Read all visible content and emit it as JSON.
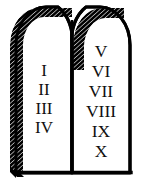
{
  "image": {
    "title": "Ten Commandments Tablets",
    "subject": "two-stone-tablets",
    "style": "black-and-white-line-art",
    "background_color": "#ffffff",
    "ink_color": "#000000",
    "numeral_color": "#101010",
    "width": 144,
    "height": 190
  },
  "tablets": {
    "count": 2,
    "shape": "round-arched-top-flat-bottom",
    "shading": "diagonal-hatching-on-upper-left-edges",
    "left": {
      "label": "left-tablet",
      "numerals": [
        {
          "value": "I",
          "order": 1
        },
        {
          "value": "II",
          "order": 2
        },
        {
          "value": "III",
          "order": 3
        },
        {
          "value": "IV",
          "order": 4
        }
      ]
    },
    "right": {
      "label": "right-tablet",
      "numerals": [
        {
          "value": "V",
          "order": 5
        },
        {
          "value": "VI",
          "order": 6
        },
        {
          "value": "VII",
          "order": 7
        },
        {
          "value": "VIII",
          "order": 8
        },
        {
          "value": "IX",
          "order": 9
        },
        {
          "value": "X",
          "order": 10
        }
      ]
    }
  }
}
